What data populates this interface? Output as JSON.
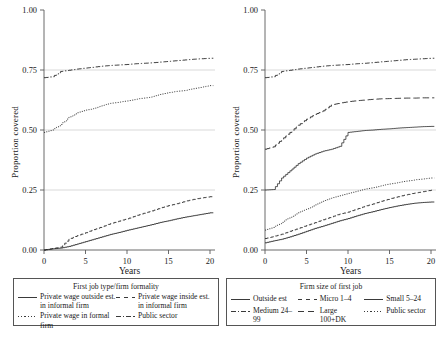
{
  "figure": {
    "panels": [
      {
        "id": "left",
        "ylabel": "Proportion covered",
        "xlabel": "Years",
        "legend_title": "First job type/firm formality",
        "yticks": [
          "0.00",
          "0.25",
          "0.50",
          "0.75",
          "1.00"
        ],
        "xticks": [
          "0",
          "5",
          "10",
          "15",
          "20"
        ]
      },
      {
        "id": "right",
        "ylabel": "Proportion covered",
        "xlabel": "Years",
        "legend_title": "Firm size of first job",
        "yticks": [
          "0.00",
          "0.25",
          "0.50",
          "0.75",
          "1.00"
        ],
        "xticks": [
          "0",
          "5",
          "10",
          "15",
          "20"
        ]
      }
    ]
  },
  "chart_data": [
    {
      "type": "line",
      "panel": "left",
      "title": "First job type/firm formality",
      "xlabel": "Years",
      "ylabel": "Proportion covered",
      "xlim": [
        0,
        20.5
      ],
      "ylim": [
        0.0,
        1.0
      ],
      "xticks": [
        0,
        5,
        10,
        15,
        20
      ],
      "yticks": [
        0.0,
        0.25,
        0.5,
        0.75,
        1.0
      ],
      "grid": "horizontal-at-0.25-0.50-0.75",
      "legend_position": "below-figure",
      "x": [
        0,
        1,
        2,
        3,
        4,
        5,
        6,
        7,
        8,
        9,
        10,
        11,
        12,
        13,
        14,
        15,
        16,
        17,
        18,
        19,
        20
      ],
      "series": [
        {
          "name": "Private wage outside est. in informal firm",
          "style": "solid",
          "values": [
            0.0,
            0.005,
            0.008,
            0.015,
            0.025,
            0.035,
            0.045,
            0.055,
            0.065,
            0.073,
            0.082,
            0.09,
            0.098,
            0.106,
            0.115,
            0.122,
            0.13,
            0.137,
            0.143,
            0.149,
            0.155
          ]
        },
        {
          "name": "Private wage inside est. in informal firm",
          "style": "dashed",
          "values": [
            0.0,
            0.006,
            0.012,
            0.045,
            0.06,
            0.072,
            0.085,
            0.097,
            0.11,
            0.12,
            0.13,
            0.142,
            0.153,
            0.163,
            0.175,
            0.185,
            0.193,
            0.203,
            0.211,
            0.217,
            0.222
          ]
        },
        {
          "name": "Private wage in formal firm",
          "style": "dotted",
          "values": [
            0.49,
            0.5,
            0.523,
            0.553,
            0.572,
            0.583,
            0.59,
            0.602,
            0.611,
            0.616,
            0.621,
            0.628,
            0.633,
            0.638,
            0.648,
            0.656,
            0.661,
            0.665,
            0.672,
            0.679,
            0.685
          ]
        },
        {
          "name": "Public sector",
          "style": "dash-dot",
          "values": [
            0.718,
            0.722,
            0.744,
            0.749,
            0.754,
            0.758,
            0.762,
            0.766,
            0.769,
            0.771,
            0.773,
            0.776,
            0.778,
            0.78,
            0.783,
            0.786,
            0.789,
            0.792,
            0.795,
            0.797,
            0.799
          ]
        }
      ]
    },
    {
      "type": "line",
      "panel": "right",
      "title": "Firm size of first job",
      "xlabel": "Years",
      "ylabel": "Proportion covered",
      "xlim": [
        0,
        20.5
      ],
      "ylim": [
        0.0,
        1.0
      ],
      "xticks": [
        0,
        5,
        10,
        15,
        20
      ],
      "yticks": [
        0.0,
        0.25,
        0.5,
        0.75,
        1.0
      ],
      "grid": "horizontal-at-0.25-0.50-0.75",
      "legend_position": "below-figure",
      "x": [
        0,
        1,
        2,
        3,
        4,
        5,
        6,
        7,
        8,
        9,
        10,
        11,
        12,
        13,
        14,
        15,
        16,
        17,
        18,
        19,
        20
      ],
      "series": [
        {
          "name": "Outside est",
          "style": "solid",
          "values": [
            0.03,
            0.038,
            0.045,
            0.055,
            0.066,
            0.078,
            0.09,
            0.1,
            0.111,
            0.122,
            0.131,
            0.142,
            0.152,
            0.16,
            0.169,
            0.177,
            0.184,
            0.19,
            0.195,
            0.198,
            0.2
          ]
        },
        {
          "name": "Micro 1-4",
          "style": "dashed",
          "values": [
            0.048,
            0.056,
            0.066,
            0.078,
            0.09,
            0.102,
            0.114,
            0.126,
            0.138,
            0.15,
            0.158,
            0.17,
            0.182,
            0.192,
            0.203,
            0.213,
            0.222,
            0.23,
            0.237,
            0.243,
            0.249
          ]
        },
        {
          "name": "Small 5-24",
          "style": "solid-thin",
          "values": [
            0.25,
            0.252,
            0.3,
            0.33,
            0.36,
            0.383,
            0.4,
            0.412,
            0.42,
            0.432,
            0.49,
            0.494,
            0.498,
            0.5,
            0.503,
            0.505,
            0.508,
            0.51,
            0.512,
            0.514,
            0.515
          ]
        },
        {
          "name": "Medium 24-99",
          "style": "long-dash",
          "values": [
            0.42,
            0.43,
            0.46,
            0.49,
            0.52,
            0.545,
            0.565,
            0.58,
            0.605,
            0.612,
            0.618,
            0.622,
            0.625,
            0.628,
            0.63,
            0.631,
            0.632,
            0.633,
            0.633,
            0.634,
            0.634
          ]
        },
        {
          "name": "Large 100+DK",
          "style": "dash-dot",
          "values": [
            0.718,
            0.722,
            0.744,
            0.749,
            0.754,
            0.758,
            0.762,
            0.766,
            0.769,
            0.771,
            0.773,
            0.776,
            0.778,
            0.781,
            0.784,
            0.787,
            0.79,
            0.793,
            0.795,
            0.797,
            0.799
          ]
        },
        {
          "name": "Public sector",
          "style": "dotted",
          "values": [
            0.083,
            0.094,
            0.115,
            0.136,
            0.155,
            0.17,
            0.188,
            0.203,
            0.216,
            0.226,
            0.236,
            0.245,
            0.253,
            0.26,
            0.268,
            0.275,
            0.281,
            0.287,
            0.292,
            0.296,
            0.3
          ]
        }
      ]
    }
  ],
  "legends": {
    "left": {
      "title": "First job type/firm formality",
      "entries": [
        {
          "label": "Private wage outside est. in informal firm",
          "style": "solid"
        },
        {
          "label": "Private wage inside est. in informal firm",
          "style": "dashed"
        },
        {
          "label": "Private wage in formal firm",
          "style": "dotted"
        },
        {
          "label": "Public sector",
          "style": "dash-dot"
        }
      ]
    },
    "right": {
      "title": "Firm size of first job",
      "entries": [
        {
          "label": "Outside est",
          "style": "solid"
        },
        {
          "label": "Micro 1–4",
          "style": "dashed"
        },
        {
          "label": "Small 5–24",
          "style": "solid"
        },
        {
          "label": "Medium 24–99",
          "style": "dash-dot"
        },
        {
          "label": "Large 100+DK",
          "style": "dashed"
        },
        {
          "label": "Public sector",
          "style": "dotted"
        }
      ]
    }
  }
}
